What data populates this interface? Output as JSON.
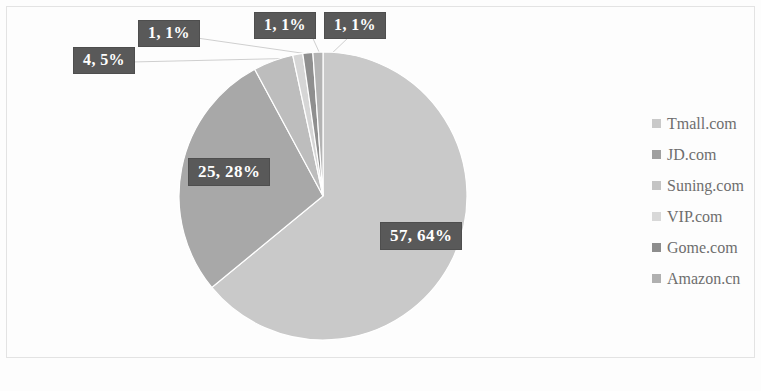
{
  "chart_data": {
    "type": "pie",
    "title": "",
    "subtitle": "",
    "xlabel": "",
    "ylabel": "",
    "grid": false,
    "legend_position": "right",
    "categories": [
      "Tmall.com",
      "JD.com",
      "Suning.com",
      "VIP.com",
      "Gome.com",
      "Amazon.cn"
    ],
    "values": [
      57,
      25,
      4,
      1,
      1,
      1
    ],
    "percents": [
      64,
      28,
      5,
      1,
      1,
      1
    ],
    "data_labels": [
      "57, 64%",
      "25, 28%",
      "4, 5%",
      "1, 1%",
      "1, 1%",
      "1, 1%"
    ],
    "slice_colors": [
      "#c9c9c9",
      "#a8a8a8",
      "#bdbdbd",
      "#d6d6d6",
      "#8f8f8f",
      "#b3b3b3"
    ],
    "total": 89,
    "start_angle": 0,
    "direction": "clockwise"
  },
  "labels": {
    "tmall": "57, 64%",
    "jd": "25, 28%",
    "suning": "4, 5%",
    "vip": "1, 1%",
    "gome": "1, 1%",
    "amazon": "1, 1%"
  },
  "legend": {
    "items": [
      {
        "label": "Tmall.com",
        "color": "#c9c9c9"
      },
      {
        "label": "JD.com",
        "color": "#a0a0a0"
      },
      {
        "label": "Suning.com",
        "color": "#c4c4c4"
      },
      {
        "label": "VIP.com",
        "color": "#d8d8d8"
      },
      {
        "label": "Gome.com",
        "color": "#8d8d8d"
      },
      {
        "label": "Amazon.cn",
        "color": "#b0b0b0"
      }
    ]
  },
  "colors": {
    "label_background": "#595959",
    "label_text": "#ffffff",
    "legend_text": "#6e6e6e",
    "frame": "#e3e3e3",
    "background": "#fdfdfd"
  }
}
